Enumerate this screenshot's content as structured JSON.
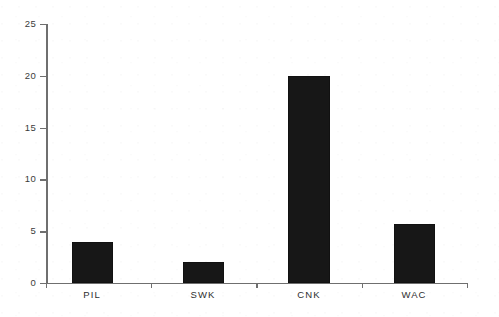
{
  "chart_data": {
    "type": "bar",
    "title": "",
    "subtitle": "",
    "xlabel": "",
    "ylabel": "",
    "categories": [
      "PIL",
      "SWK",
      "CNK",
      "WAC"
    ],
    "values": [
      4,
      2,
      20,
      5.7
    ],
    "series": [
      {
        "name": "",
        "values": [
          4,
          2,
          20,
          5.7
        ]
      }
    ],
    "ylim": [
      0,
      25
    ],
    "y_ticks": [
      0,
      5,
      10,
      15,
      20,
      25
    ],
    "y_tick_labels": [
      "0",
      "5",
      "10",
      "15",
      "20",
      "25"
    ],
    "x_tick_labels": [
      "PIL",
      "SWK",
      "CNK",
      "WAC"
    ],
    "grid": false,
    "legend": false,
    "legend_position": "none",
    "bar_color": "#171717",
    "axis_color": "#6f6f6f",
    "text_color": "#2e2e2e",
    "background_color": "#ffffff",
    "annotations": []
  }
}
